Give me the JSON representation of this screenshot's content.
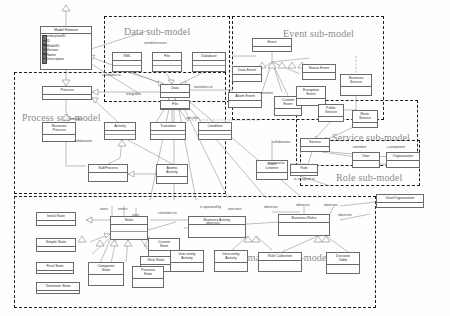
{
  "diagram": {
    "regions": [
      {
        "key": "data",
        "label": "Data sub-model"
      },
      {
        "key": "event",
        "label": "Event sub-model"
      },
      {
        "key": "process",
        "label": "Process sub-model"
      },
      {
        "key": "service",
        "label": "Service sub-model"
      },
      {
        "key": "role",
        "label": "Role sub-model"
      },
      {
        "key": "state",
        "label": "State machine sub-model"
      }
    ],
    "model_element": {
      "name": "Model Element",
      "attributes": [
        "enterpriseID",
        "ID",
        "ModelID",
        "Version",
        "Name",
        "Description"
      ]
    },
    "classes": {
      "xml": "XML",
      "file": "File",
      "database": "Database",
      "data": "Data",
      "data_sub": "File",
      "process": "Process",
      "business_process": "Business\nProcess",
      "activity": "Activity",
      "subprocess": "SubProcess",
      "atomic_activity": "Atomic\nActivity",
      "transition": "Transition",
      "condition": "Condition",
      "event": "Event",
      "status_event": "Status Event",
      "exception_event": "Exception\nEvent",
      "data_event": "Data Event",
      "alarm_event": "Alarm Event",
      "custom_event": "Custom\nEvent",
      "event_listener": "Event\nListener",
      "business_service": "Business\nService",
      "public_service": "Public\nService",
      "basic_service": "Basic\nService",
      "service": "Service",
      "role": "Role",
      "user": "User",
      "organization": "Organization",
      "user_organization": "User/Organization",
      "initial_state": "Initial State",
      "simple_state": "Simple State",
      "final_state": "Final State",
      "terminate_state": "Terminate State",
      "state": "State",
      "composite_state": "Composite\nState",
      "current_state": "Current\nState",
      "next_state": "Next State",
      "previous_state": "Previous\nState",
      "business_activity": "Business Activity",
      "inter_entity_activity": "Inter-entity\nActivity",
      "intra_entity_activity": "Intra-entity\nActivity",
      "business_rules": "Business Rules",
      "rule_collection": "Rule Collection",
      "decision_table": "Decision\nTable"
    },
    "edge_labels": {
      "sends_receives": "sends/receives",
      "correlates_to": "correlates to",
      "integrates": "integrates",
      "translates_to": "translates to",
      "includes": "includes",
      "collaborates_process": "collaborates",
      "monitors": "monitors",
      "specifies": "specifies",
      "collaborates_service": "collaborates",
      "cooperates": "cooperates",
      "is_assigned_to": "is assigned to",
      "member": "+member",
      "component": "+component",
      "owns": "owns",
      "enters": "enters",
      "exits": "exits",
      "correlates_to_state": "correlates to",
      "is_operated_by": "is operated by",
      "executes": "executes",
      "observes_1": "observes",
      "observes_2": "observes",
      "observes_3": "observes",
      "observes_4": "observes",
      "observes_5": "observes"
    },
    "colors": {
      "line": "#8a8a8a",
      "box_border": "#6a6a6a",
      "region_border": "#1c1c1c",
      "region_title": "#8a8a8a",
      "background": "#ffffff"
    }
  }
}
